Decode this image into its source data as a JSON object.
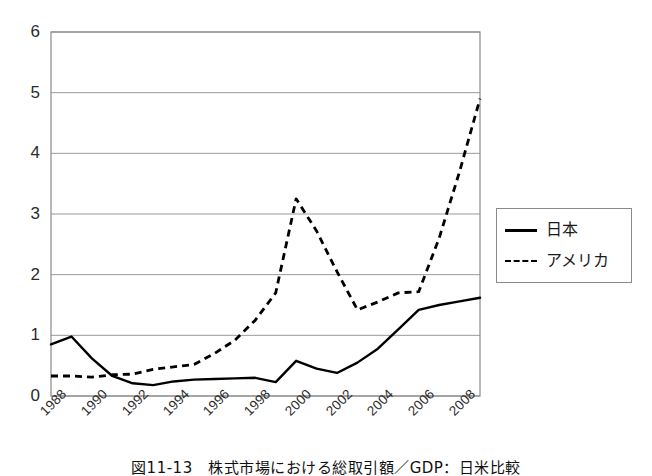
{
  "figure": {
    "caption": "図11-13　株式市場における総取引額／GDP：日米比較"
  },
  "legend": {
    "position": "right",
    "entries": [
      {
        "label": "日本",
        "style": "solid",
        "key_name": "solid-line-key"
      },
      {
        "label": "アメリカ",
        "style": "dashed",
        "key_name": "dashed-line-key"
      }
    ]
  },
  "axes": {
    "y_ticks": [
      "0",
      "1",
      "2",
      "3",
      "4",
      "5",
      "6"
    ],
    "x_ticks": [
      "1988",
      "1990",
      "1992",
      "1994",
      "1996",
      "1998",
      "2000",
      "2002",
      "2004",
      "2006",
      "2008"
    ]
  },
  "colors": {
    "line": "#000000",
    "grid": "#9a9a9a",
    "frame": "#8a8a8a",
    "text": "#1a1a1a",
    "background": "#ffffff"
  },
  "chart_data": {
    "type": "line",
    "title": "図11-13　株式市場における総取引額／GDP：日米比較",
    "xlabel": "",
    "ylabel": "",
    "ylim": [
      0,
      6
    ],
    "yticks": [
      0,
      1,
      2,
      3,
      4,
      5,
      6
    ],
    "grid": true,
    "legend_position": "right",
    "x": [
      1988,
      1989,
      1990,
      1991,
      1992,
      1993,
      1994,
      1995,
      1996,
      1997,
      1998,
      1999,
      2000,
      2001,
      2002,
      2003,
      2004,
      2005,
      2006,
      2007,
      2008,
      2009
    ],
    "x_tick_labels": [
      "1988",
      "1990",
      "1992",
      "1994",
      "1996",
      "1998",
      "2000",
      "2002",
      "2004",
      "2006",
      "2008"
    ],
    "x_tick_values": [
      1988,
      1990,
      1992,
      1994,
      1996,
      1998,
      2000,
      2002,
      2004,
      2006,
      2008
    ],
    "series": [
      {
        "name": "日本",
        "style": "solid",
        "values": [
          0.85,
          0.98,
          0.62,
          0.33,
          0.21,
          0.18,
          0.24,
          0.27,
          0.28,
          0.29,
          0.3,
          0.23,
          0.58,
          0.45,
          0.38,
          0.55,
          0.78,
          1.1,
          1.42,
          1.5,
          1.56,
          1.62
        ]
      },
      {
        "name": "アメリカ",
        "style": "dashed",
        "values": [
          0.33,
          0.33,
          0.31,
          0.35,
          0.36,
          0.44,
          0.48,
          0.52,
          0.7,
          0.92,
          1.25,
          1.7,
          3.25,
          2.72,
          2.05,
          1.42,
          1.55,
          1.7,
          1.72,
          2.6,
          3.7,
          4.9
        ]
      }
    ]
  }
}
